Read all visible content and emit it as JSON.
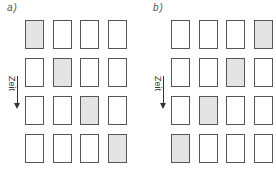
{
  "panels": [
    {
      "label": "a)",
      "axis_label": "Zeit",
      "grid": [
        [
          1,
          0,
          0,
          0
        ],
        [
          0,
          1,
          0,
          0
        ],
        [
          0,
          0,
          1,
          0
        ],
        [
          0,
          0,
          0,
          1
        ]
      ]
    },
    {
      "label": "b)",
      "axis_label": "Zeit",
      "grid": [
        [
          0,
          0,
          0,
          1
        ],
        [
          0,
          0,
          1,
          0
        ],
        [
          0,
          1,
          0,
          0
        ],
        [
          1,
          0,
          0,
          0
        ]
      ]
    }
  ],
  "colors": {
    "filled": "#e4e4e4",
    "empty": "#ffffff",
    "border": "#555555"
  }
}
